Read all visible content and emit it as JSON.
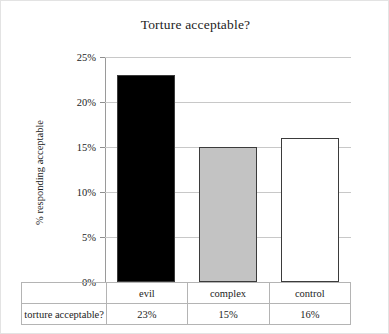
{
  "chart_data": {
    "type": "bar",
    "title": "Torture acceptable?",
    "xlabel": "",
    "ylabel": "% responding acceptable",
    "categories": [
      "evil",
      "complex",
      "control"
    ],
    "values": [
      23,
      15,
      16
    ],
    "value_labels": [
      "23%",
      "15%",
      "16%"
    ],
    "ylim": [
      0,
      25
    ],
    "yticks": [
      0,
      5,
      10,
      15,
      20,
      25
    ],
    "ytick_labels": [
      "0%",
      "5%",
      "10%",
      "15%",
      "20%",
      "25%"
    ],
    "grid": true,
    "legend": "none",
    "series_row_label": "torture acceptable?",
    "bar_colors": [
      "#000000",
      "#c3c3c3",
      "#ffffff"
    ],
    "bar_edge_color": "#3b3b3b"
  },
  "table": {
    "row_label": "torture acceptable?",
    "header_cells": [
      "evil",
      "complex",
      "control"
    ],
    "value_cells": [
      "23%",
      "15%",
      "16%"
    ]
  }
}
